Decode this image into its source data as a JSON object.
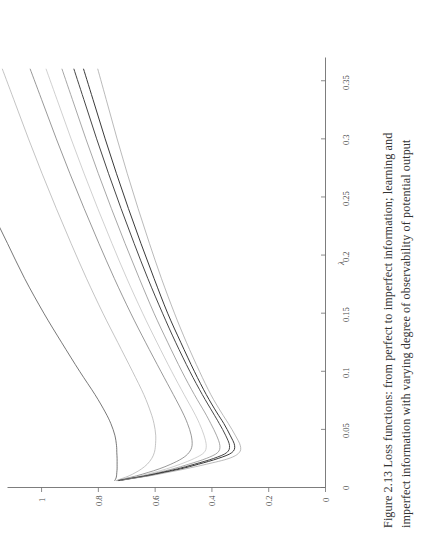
{
  "figure": {
    "caption_line1": "Figure 2.13  Loss functions: from perfect to imperfect information; learning and",
    "caption_line2": "imperfect information with varying degree of observability of potential output",
    "caption_full": "Figure 2.13  Loss functions: from perfect to imperfect information; learning and imperfect information with varying degree of observability of potential output",
    "figure_number": "2.13",
    "orientation": "rotated-90-ccw"
  },
  "chart_data": {
    "type": "line",
    "xlabel": "λ",
    "ylabel": "",
    "xlim": [
      0,
      0.37
    ],
    "ylim": [
      0,
      1.12
    ],
    "grid": false,
    "legend": "none",
    "xticks": [
      "0",
      "0.05",
      "0.1",
      "0.15",
      "0.2",
      "0.25",
      "0.3",
      "0.35"
    ],
    "xtick_values": [
      0,
      0.05,
      0.1,
      0.15,
      0.2,
      0.25,
      0.3,
      0.35
    ],
    "yticks": [
      "0",
      "0.2",
      "0.4",
      "0.6",
      "0.8",
      "1"
    ],
    "ytick_values": [
      0,
      0.2,
      0.4,
      0.6,
      0.8,
      1
    ],
    "series": [
      {
        "name": "curve-1-perfect-information",
        "color": "#555555",
        "width": 0.8,
        "minimum": {
          "x": 0.045,
          "y": 0.735
        },
        "x": [
          0.006,
          0.008,
          0.01,
          0.013,
          0.016,
          0.02,
          0.025,
          0.03,
          0.036,
          0.045,
          0.055,
          0.065,
          0.08,
          0.1,
          0.125,
          0.15,
          0.18,
          0.21,
          0.24,
          0.27,
          0.3,
          0.33,
          0.36
        ],
        "y": [
          0.742,
          0.738,
          0.736,
          0.735,
          0.734,
          0.734,
          0.734,
          0.735,
          0.736,
          0.742,
          0.756,
          0.776,
          0.812,
          0.866,
          0.93,
          0.992,
          1.06,
          1.12,
          1.18,
          1.238,
          1.295,
          1.35,
          1.404
        ]
      },
      {
        "name": "curve-2",
        "color": "#aaaaaa",
        "width": 0.7,
        "minimum": {
          "x": 0.04,
          "y": 0.598
        },
        "x": [
          0.006,
          0.008,
          0.01,
          0.013,
          0.016,
          0.02,
          0.025,
          0.03,
          0.036,
          0.045,
          0.055,
          0.065,
          0.08,
          0.1,
          0.125,
          0.15,
          0.18,
          0.21,
          0.24,
          0.27,
          0.3,
          0.33,
          0.36
        ],
        "y": [
          0.736,
          0.714,
          0.692,
          0.668,
          0.648,
          0.628,
          0.612,
          0.603,
          0.599,
          0.598,
          0.604,
          0.616,
          0.64,
          0.68,
          0.732,
          0.784,
          0.842,
          0.896,
          0.948,
          0.998,
          1.046,
          1.092,
          1.138
        ]
      },
      {
        "name": "curve-3",
        "color": "#777777",
        "width": 0.75,
        "minimum": {
          "x": 0.033,
          "y": 0.47
        },
        "x": [
          0.006,
          0.008,
          0.01,
          0.013,
          0.016,
          0.02,
          0.025,
          0.03,
          0.036,
          0.045,
          0.055,
          0.065,
          0.08,
          0.1,
          0.125,
          0.15,
          0.18,
          0.21,
          0.24,
          0.27,
          0.3,
          0.33,
          0.36
        ],
        "y": [
          0.734,
          0.7,
          0.666,
          0.624,
          0.586,
          0.545,
          0.505,
          0.481,
          0.47,
          0.473,
          0.486,
          0.504,
          0.536,
          0.58,
          0.634,
          0.686,
          0.744,
          0.798,
          0.85,
          0.9,
          0.948,
          0.994,
          1.04
        ]
      },
      {
        "name": "curve-4",
        "color": "#bbbbbb",
        "width": 0.7,
        "minimum": {
          "x": 0.03,
          "y": 0.42
        },
        "x": [
          0.006,
          0.008,
          0.01,
          0.013,
          0.016,
          0.02,
          0.025,
          0.03,
          0.036,
          0.045,
          0.055,
          0.065,
          0.08,
          0.1,
          0.125,
          0.15,
          0.18,
          0.21,
          0.24,
          0.27,
          0.3,
          0.33,
          0.36
        ],
        "y": [
          0.732,
          0.692,
          0.652,
          0.604,
          0.56,
          0.512,
          0.462,
          0.428,
          0.42,
          0.428,
          0.444,
          0.464,
          0.498,
          0.542,
          0.594,
          0.644,
          0.7,
          0.752,
          0.802,
          0.85,
          0.896,
          0.94,
          0.984
        ]
      },
      {
        "name": "curve-5",
        "color": "#8a8a8a",
        "width": 0.75,
        "minimum": {
          "x": 0.026,
          "y": 0.372
        },
        "x": [
          0.006,
          0.008,
          0.01,
          0.013,
          0.016,
          0.02,
          0.025,
          0.03,
          0.036,
          0.045,
          0.055,
          0.065,
          0.08,
          0.1,
          0.125,
          0.15,
          0.18,
          0.21,
          0.24,
          0.27,
          0.3,
          0.33,
          0.36
        ],
        "y": [
          0.73,
          0.686,
          0.642,
          0.588,
          0.538,
          0.482,
          0.42,
          0.38,
          0.372,
          0.384,
          0.404,
          0.426,
          0.462,
          0.506,
          0.556,
          0.604,
          0.656,
          0.706,
          0.754,
          0.8,
          0.844,
          0.886,
          0.928
        ]
      },
      {
        "name": "curve-6",
        "color": "#3c3c3c",
        "width": 0.95,
        "minimum": {
          "x": 0.024,
          "y": 0.338
        },
        "x": [
          0.006,
          0.008,
          0.01,
          0.013,
          0.016,
          0.02,
          0.025,
          0.03,
          0.036,
          0.045,
          0.055,
          0.065,
          0.08,
          0.1,
          0.125,
          0.15,
          0.18,
          0.21,
          0.24,
          0.27,
          0.3,
          0.33,
          0.36
        ],
        "y": [
          0.728,
          0.682,
          0.634,
          0.576,
          0.522,
          0.462,
          0.394,
          0.348,
          0.338,
          0.352,
          0.374,
          0.398,
          0.434,
          0.478,
          0.528,
          0.574,
          0.626,
          0.674,
          0.72,
          0.764,
          0.806,
          0.846,
          0.886
        ]
      },
      {
        "name": "curve-7",
        "color": "#2e2e2e",
        "width": 0.95,
        "minimum": {
          "x": 0.022,
          "y": 0.32
        },
        "x": [
          0.006,
          0.008,
          0.01,
          0.013,
          0.016,
          0.02,
          0.025,
          0.03,
          0.036,
          0.045,
          0.055,
          0.065,
          0.08,
          0.1,
          0.125,
          0.15,
          0.18,
          0.21,
          0.24,
          0.27,
          0.3,
          0.33,
          0.36
        ],
        "y": [
          0.726,
          0.678,
          0.628,
          0.568,
          0.51,
          0.448,
          0.378,
          0.33,
          0.32,
          0.336,
          0.358,
          0.384,
          0.42,
          0.462,
          0.51,
          0.556,
          0.604,
          0.65,
          0.694,
          0.736,
          0.776,
          0.814,
          0.852
        ]
      },
      {
        "name": "curve-8",
        "color": "#9c9c9c",
        "width": 0.7,
        "minimum": {
          "x": 0.02,
          "y": 0.3
        },
        "x": [
          0.006,
          0.008,
          0.01,
          0.013,
          0.016,
          0.02,
          0.025,
          0.03,
          0.036,
          0.045,
          0.055,
          0.065,
          0.08,
          0.1,
          0.125,
          0.15,
          0.18,
          0.21,
          0.24,
          0.27,
          0.3,
          0.33,
          0.36
        ],
        "y": [
          0.724,
          0.674,
          0.62,
          0.556,
          0.494,
          0.42,
          0.34,
          0.304,
          0.3,
          0.318,
          0.342,
          0.368,
          0.404,
          0.444,
          0.49,
          0.532,
          0.578,
          0.62,
          0.66,
          0.698,
          0.734,
          0.768,
          0.802
        ]
      }
    ]
  },
  "axes": {
    "x_axis_label": "λ",
    "x_tick_labels": [
      "0",
      "0.05",
      "0.1",
      "0.15",
      "0.2",
      "0.25",
      "0.3",
      "0.35"
    ],
    "y_tick_labels": [
      "0",
      "0.2",
      "0.4",
      "0.6",
      "0.8",
      "1"
    ],
    "axis_color": "#6e6e6e"
  },
  "colors": {
    "background": "#ffffff",
    "axis": "#6e6e6e",
    "text": "#3a3a3a",
    "caption": "#333333"
  }
}
